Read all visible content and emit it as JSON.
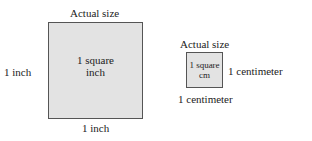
{
  "inch_diagram": {
    "title": "Actual size",
    "side_left": "1 inch",
    "side_bottom": "1 inch",
    "area_line1": "1 square",
    "area_line2": "inch"
  },
  "cm_diagram": {
    "title": "Actual size",
    "side_right": "1 centimeter",
    "side_bottom": "1 centimeter",
    "area_line1": "1 square",
    "area_line2": "cm"
  },
  "colors": {
    "fill": "#e3e3e3",
    "border": "#555555"
  }
}
